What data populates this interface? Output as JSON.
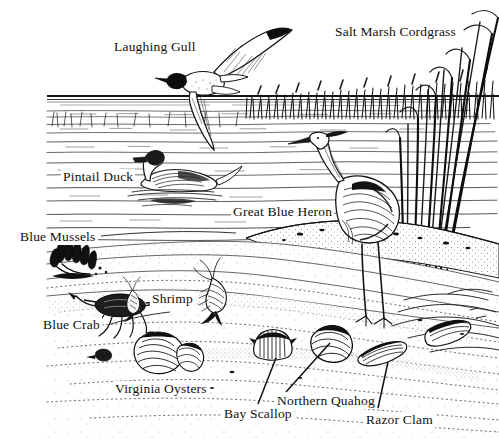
{
  "figure": {
    "style": "black-and-white pen-and-ink scientific illustration",
    "background_color": "#ffffff",
    "ink_color": "#101010",
    "width": 499,
    "height": 442
  },
  "labels": {
    "laughing_gull": "Laughing Gull",
    "salt_marsh_cordgrass": "Salt Marsh Cordgrass",
    "pintail_duck": "Pintail Duck",
    "great_blue_heron": "Great Blue Heron",
    "blue_mussels": "Blue Mussels",
    "shrimp": "Shrimp",
    "blue_crab": "Blue Crab",
    "virginia_oysters": "Virginia Oysters",
    "bay_scallop": "Bay Scallop",
    "northern_quahog": "Northern Quahog",
    "razor_clam": "Razor Clam"
  },
  "organisms": [
    {
      "name": "Laughing Gull",
      "habitat": "air above water",
      "leader_line": false
    },
    {
      "name": "Salt Marsh Cordgrass",
      "habitat": "marsh bank",
      "leader_line": false
    },
    {
      "name": "Pintail Duck",
      "habitat": "water surface",
      "leader_line": false
    },
    {
      "name": "Great Blue Heron",
      "habitat": "shallow water / shore",
      "leader_line": false
    },
    {
      "name": "Blue Mussels",
      "habitat": "mud flat",
      "leader_line": true
    },
    {
      "name": "Shrimp",
      "habitat": "mud flat",
      "leader_line": false
    },
    {
      "name": "Blue Crab",
      "habitat": "mud flat",
      "leader_line": true
    },
    {
      "name": "Virginia Oysters",
      "habitat": "mud flat",
      "leader_line": false
    },
    {
      "name": "Bay Scallop",
      "habitat": "sand bottom",
      "leader_line": true
    },
    {
      "name": "Northern Quahog",
      "habitat": "sand bottom",
      "leader_line": true
    },
    {
      "name": "Razor Clam",
      "habitat": "sand bottom",
      "leader_line": true
    }
  ]
}
